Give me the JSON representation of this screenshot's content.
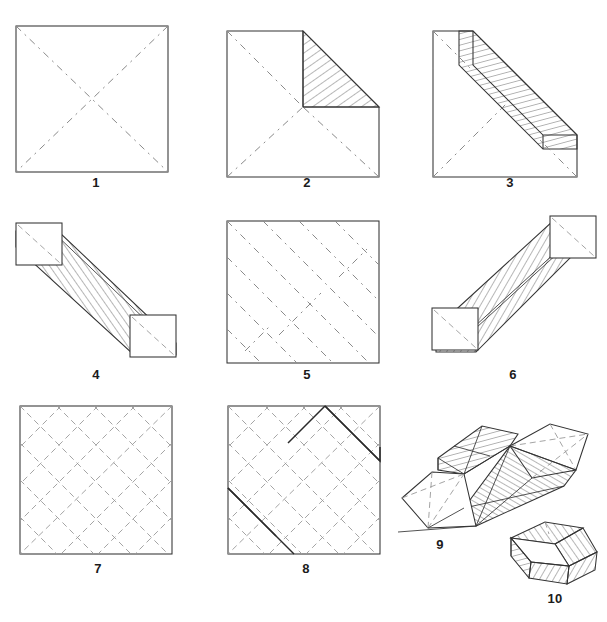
{
  "document": {
    "title": "Origami Box Folding Instructions",
    "type": "step-by-step folding diagram",
    "background_color": "#ffffff",
    "line_color": "#333333",
    "crease_color": "#8a8a8a",
    "hatch_color": "#4a4a4a",
    "step_count": 10
  },
  "steps": [
    {
      "number": "1",
      "label": "1",
      "caption": "Square sheet with both diagonals creased",
      "figure": "square-with-diagonal-creases",
      "has_hatching": false
    },
    {
      "number": "2",
      "label": "2",
      "caption": "Top right corner folded down to the centre, hatched flap visible",
      "figure": "square-corner-folded",
      "has_hatching": true
    },
    {
      "number": "3",
      "label": "3",
      "caption": "Opposite corner folded, hatched band along the diagonal",
      "figure": "triangle-with-hatched-band",
      "has_hatching": true
    },
    {
      "number": "4",
      "label": "4",
      "caption": "Folded into a long hatched strip with square ends",
      "figure": "diagonal-hatched-strip",
      "has_hatching": true
    },
    {
      "number": "5",
      "label": "5",
      "caption": "Unfolded square showing the diagonal crease pattern",
      "figure": "square-diagonal-creases-many",
      "has_hatching": false
    },
    {
      "number": "6",
      "label": "6",
      "caption": "Strip rotated, shown as a hatched prism with square ends",
      "figure": "hatched-prism",
      "has_hatching": true
    },
    {
      "number": "7",
      "label": "7",
      "caption": "Completed diamond lattice of creases",
      "figure": "square-diamond-lattice",
      "has_hatching": false
    },
    {
      "number": "8",
      "label": "8",
      "caption": "Same lattice with one zig-zag fold line emphasised",
      "figure": "square-diamond-lattice-highlighted",
      "has_hatching": false
    },
    {
      "number": "9",
      "label": "9",
      "caption": "Paper collapsing into three dimensions",
      "figure": "partially-collapsed-form",
      "has_hatching": true
    },
    {
      "number": "10",
      "label": "10",
      "caption": "Finished open box with hatched walls",
      "figure": "finished-box",
      "has_hatching": true
    }
  ]
}
